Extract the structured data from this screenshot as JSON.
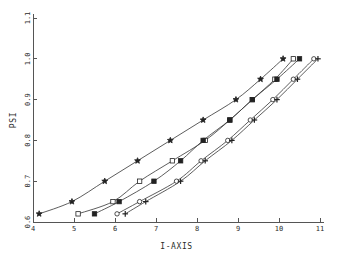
{
  "chart_data": {
    "type": "line",
    "title": "",
    "xlabel": "I-AXIS",
    "ylabel": "PSI",
    "xlim": [
      4,
      11
    ],
    "ylim": [
      0.6,
      1.1
    ],
    "grid": false,
    "legend": "none",
    "xticks": [
      "4",
      "5",
      "6",
      "7",
      "8",
      "9",
      "10",
      "11"
    ],
    "xtick_values": [
      4,
      5,
      6,
      7,
      8,
      9,
      10,
      11
    ],
    "yticks": [
      "0.6",
      "0.7",
      "0.8",
      "0.9",
      "1.0",
      "1.1"
    ],
    "ytick_values": [
      0.6,
      0.7,
      0.8,
      0.9,
      1.0,
      1.1
    ],
    "series": [
      {
        "name": "curve-1",
        "marker": "star",
        "marker_style": "filled",
        "x": [
          4.15,
          4.95,
          5.75,
          6.55,
          7.35,
          8.15,
          8.95,
          9.55,
          10.1
        ],
        "y": [
          0.62,
          0.65,
          0.7,
          0.75,
          0.8,
          0.85,
          0.9,
          0.95,
          1.0
        ]
      },
      {
        "name": "curve-2",
        "marker": "square",
        "marker_style": "open",
        "x": [
          5.1,
          5.95,
          6.6,
          7.4,
          8.2,
          8.8,
          9.35,
          9.9,
          10.35
        ],
        "y": [
          0.62,
          0.65,
          0.7,
          0.75,
          0.8,
          0.85,
          0.9,
          0.95,
          1.0
        ]
      },
      {
        "name": "curve-3",
        "marker": "square",
        "marker_style": "filled",
        "x": [
          5.5,
          6.1,
          6.95,
          7.6,
          8.15,
          8.8,
          9.35,
          9.95,
          10.5
        ],
        "y": [
          0.62,
          0.65,
          0.7,
          0.75,
          0.8,
          0.85,
          0.9,
          0.95,
          1.0
        ]
      },
      {
        "name": "curve-4",
        "marker": "circle",
        "marker_style": "open",
        "x": [
          6.05,
          6.6,
          7.5,
          8.1,
          8.75,
          9.3,
          9.85,
          10.35,
          10.85
        ],
        "y": [
          0.62,
          0.65,
          0.7,
          0.75,
          0.8,
          0.85,
          0.9,
          0.95,
          1.0
        ]
      },
      {
        "name": "curve-5",
        "marker": "plus",
        "marker_style": "filled",
        "x": [
          6.25,
          6.75,
          7.6,
          8.2,
          8.85,
          9.4,
          9.95,
          10.45,
          10.95
        ],
        "y": [
          0.62,
          0.65,
          0.7,
          0.75,
          0.8,
          0.85,
          0.9,
          0.95,
          1.0
        ]
      }
    ]
  }
}
